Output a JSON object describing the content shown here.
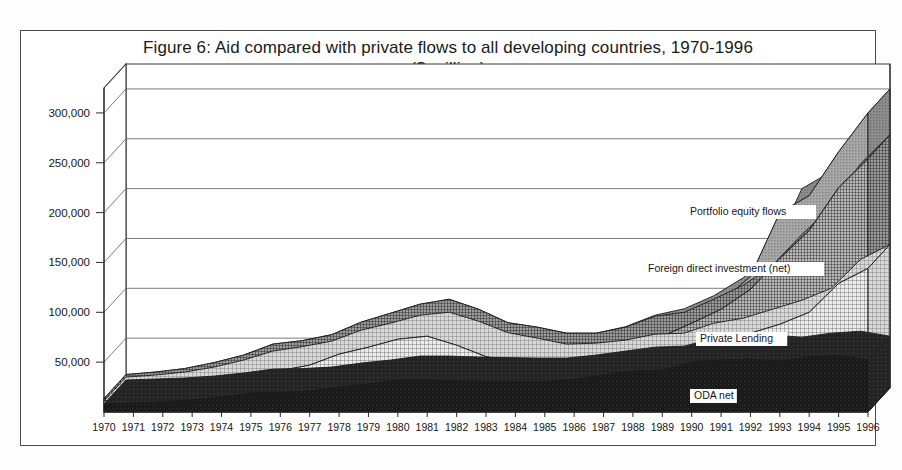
{
  "figure": {
    "title_line1": "Figure 6: Aid compared with private flows to all developing countries, 1970-1996",
    "title_line2": "($ million)"
  },
  "chart_data": {
    "type": "area",
    "stacked": true,
    "title": "Figure 6: Aid compared with private flows to all developing countries, 1970-1996 ($ million)",
    "xlabel": "",
    "ylabel": "$ million",
    "ylim": [
      0,
      325000
    ],
    "yticks": [
      50000,
      100000,
      150000,
      200000,
      250000,
      300000
    ],
    "ytick_labels": [
      "50,000",
      "100,000",
      "150,000",
      "200,000",
      "250,000",
      "300,000"
    ],
    "grid": true,
    "legend_position": "inline-annotations",
    "projection": "3d-ribbon",
    "categories": [
      "1970",
      "1971",
      "1972",
      "1973",
      "1974",
      "1975",
      "1976",
      "1977",
      "1978",
      "1979",
      "1980",
      "1981",
      "1982",
      "1983",
      "1984",
      "1985",
      "1986",
      "1987",
      "1988",
      "1989",
      "1990",
      "1991",
      "1992",
      "1993",
      "1994",
      "1995",
      "1996"
    ],
    "series": [
      {
        "name": "ODA net",
        "pattern": "solid-black",
        "color": "#1b1b1b",
        "values": [
          8000,
          9000,
          10000,
          12000,
          15000,
          19000,
          19500,
          21000,
          25000,
          28000,
          32000,
          32000,
          31000,
          30500,
          30000,
          30000,
          33000,
          37000,
          41000,
          42000,
          50000,
          52000,
          53000,
          51000,
          55000,
          57000,
          52000
        ]
      },
      {
        "name": "Private Lending",
        "pattern": "fine-grid",
        "color": "#d2d2d2",
        "values": [
          3000,
          4000,
          6000,
          9000,
          13000,
          18000,
          22000,
          26000,
          33000,
          37000,
          41000,
          44000,
          36000,
          25000,
          20000,
          14000,
          12000,
          11000,
          13000,
          13000,
          15000,
          18000,
          26000,
          37000,
          45000,
          72000,
          92000
        ]
      },
      {
        "name": "Foreign direct investment (net)",
        "pattern": "dark-crosshatch",
        "color": "#8c8c8c",
        "values": [
          2500,
          3000,
          3500,
          4500,
          5000,
          7000,
          6000,
          6500,
          8000,
          10000,
          11000,
          13000,
          12000,
          10000,
          11000,
          11000,
          10000,
          13000,
          18000,
          21000,
          24000,
          33000,
          44000,
          66000,
          82000,
          96000,
          110000
        ]
      },
      {
        "name": "Portfolio equity flows",
        "pattern": "medium-gray",
        "color": "#9a9a9a",
        "values": [
          0,
          0,
          0,
          0,
          0,
          0,
          0,
          0,
          0,
          0,
          0,
          0,
          0,
          0,
          0,
          0,
          0,
          500,
          1000,
          3500,
          3500,
          7500,
          13000,
          46000,
          35000,
          36000,
          46000
        ]
      }
    ],
    "annotations": [
      {
        "text": "Portfolio equity flows",
        "series": "Portfolio equity flows"
      },
      {
        "text": "Foreign direct investment (net)",
        "series": "Foreign direct investment (net)"
      },
      {
        "text": "Private Lending",
        "series": "Private Lending"
      },
      {
        "text": "ODA net",
        "series": "ODA net"
      }
    ]
  }
}
